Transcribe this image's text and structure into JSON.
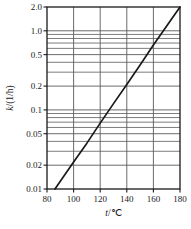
{
  "chart_data": {
    "type": "line",
    "title": "",
    "xlabel": "t/℃",
    "ylabel": "k/(1/h)",
    "yscale": "log",
    "xscale": "linear",
    "xlim": [
      80,
      180
    ],
    "ylim": [
      0.01,
      2.0
    ],
    "grid": true,
    "legend": null,
    "xticks": [
      80,
      100,
      120,
      140,
      160,
      180
    ],
    "xticklabels": [
      "80",
      "100",
      "120",
      "140",
      "160",
      "180"
    ],
    "yticks": [
      0.01,
      0.02,
      0.05,
      0.1,
      0.2,
      0.5,
      1.0,
      2.0
    ],
    "yticklabels": [
      "0.01",
      "0.02",
      "0.05",
      "0.1",
      "0.2",
      "0.5",
      "1.0",
      "2.0"
    ],
    "y_minor_gridlines": [
      0.03,
      0.04,
      0.06,
      0.07,
      0.08,
      0.09,
      0.3,
      0.4,
      0.6,
      0.7,
      0.8,
      0.9
    ],
    "x_gridlines": [
      100,
      120,
      140,
      160
    ],
    "series": [
      {
        "name": "k",
        "x": [
          86,
          90,
          100,
          110,
          120,
          130,
          140,
          150,
          160,
          170,
          180
        ],
        "y": [
          0.01,
          0.0125,
          0.022,
          0.038,
          0.068,
          0.12,
          0.21,
          0.37,
          0.66,
          1.15,
          2.0
        ]
      }
    ]
  },
  "figure": {
    "line_color": "#1a1a1a",
    "grid_color": "#5a5a5a",
    "frame_color": "#1a1a1a",
    "background": "#ffffff"
  }
}
